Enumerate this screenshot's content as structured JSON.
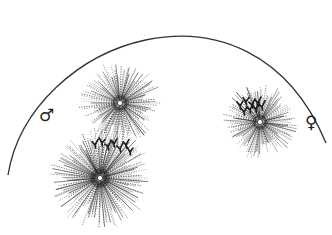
{
  "figure": {
    "colors": {
      "ink": "#1a1a1a",
      "background": "#ffffff"
    },
    "labels": {
      "male": {
        "symbol": "♂",
        "x": 46,
        "y": 117
      },
      "female": {
        "symbol": "♀",
        "x": 311,
        "y": 124
      }
    },
    "membrane_arc": {
      "start": [
        8,
        175
      ],
      "control1": [
        30,
        40
      ],
      "control2": [
        250,
        -40
      ],
      "end": [
        326,
        143
      ]
    },
    "asters": [
      {
        "name": "upper-male-aster",
        "cx": 120,
        "cy": 103,
        "r": 40,
        "rays": 140
      },
      {
        "name": "lower-male-aster",
        "cx": 100,
        "cy": 178,
        "r": 50,
        "rays": 170
      },
      {
        "name": "female-aster",
        "cx": 260,
        "cy": 122,
        "r": 37,
        "rays": 130
      }
    ],
    "chromosomes": {
      "spindle": [
        [
          95,
          143
        ],
        [
          102,
          141
        ],
        [
          108,
          145
        ],
        [
          114,
          142
        ],
        [
          120,
          147
        ],
        [
          126,
          143
        ],
        [
          130,
          150
        ]
      ],
      "female_cluster": [
        [
          240,
          104
        ],
        [
          246,
          100
        ],
        [
          252,
          103
        ],
        [
          258,
          101
        ],
        [
          244,
          110
        ],
        [
          250,
          108
        ],
        [
          256,
          107
        ],
        [
          262,
          105
        ]
      ]
    }
  }
}
